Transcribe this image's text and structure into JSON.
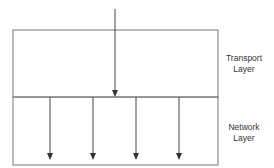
{
  "diagram": {
    "title": "",
    "layers": [
      {
        "name_line1": "Transport",
        "name_line2": "Layer"
      },
      {
        "name_line1": "Network",
        "name_line2": "Layer"
      }
    ],
    "input_arrows": 1,
    "output_arrows": 4,
    "colors": {
      "stroke": "#555555",
      "text": "#333333",
      "background": "#ffffff"
    }
  }
}
